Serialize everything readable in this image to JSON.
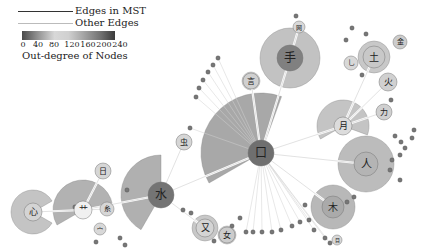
{
  "legend": {
    "mst_label": "Edges in MST",
    "other_label": "Other Edges",
    "colorbar_title": "Out-degree of Nodes",
    "colorbar_ticks": [
      "0",
      "40",
      "80",
      "120",
      "160",
      "200",
      "240"
    ],
    "mst_color": "#333333",
    "other_color": "#bbbbbb"
  },
  "nodes": [
    {
      "id": "kou",
      "label": "口",
      "x": 261,
      "y": 153,
      "r": 13,
      "fill": "#6f6f6f",
      "fan_r": 60,
      "fan_start": 150,
      "fan_end": 290,
      "fan_fill": "#a8a8a8"
    },
    {
      "id": "shui",
      "label": "水",
      "x": 161,
      "y": 195,
      "r": 13,
      "fill": "#747474",
      "fan_r": 40,
      "fan_start": 120,
      "fan_end": 270,
      "fan_fill": "#b0b0b0"
    },
    {
      "id": "shou",
      "label": "手",
      "x": 290,
      "y": 58,
      "r": 13,
      "fill": "#808080",
      "fan_r": 30,
      "fan_start": 0,
      "fan_end": 360,
      "fan_fill": "#c2c2c2"
    },
    {
      "id": "ren",
      "label": "人",
      "x": 366,
      "y": 164,
      "r": 12,
      "fill": "#b4b4b4",
      "fan_r": 28,
      "fan_start": 0,
      "fan_end": 360,
      "fan_fill": "#bcbcbc"
    },
    {
      "id": "mu",
      "label": "木",
      "x": 333,
      "y": 207,
      "r": 11,
      "fill": "#aaaaaa",
      "fan_r": 22,
      "fan_start": 0,
      "fan_end": 360,
      "fan_fill": "#b8b8b8"
    },
    {
      "id": "yue",
      "label": "月",
      "x": 343,
      "y": 126,
      "r": 9,
      "fill": "#dcdcdc",
      "fan_r": 26,
      "fan_start": 150,
      "fan_end": 380,
      "fan_fill": "#c4c4c4"
    },
    {
      "id": "tu",
      "label": "土",
      "x": 374,
      "y": 57,
      "r": 11,
      "fill": "#c8c8c8",
      "fan_r": 16,
      "fan_start": 0,
      "fan_end": 360,
      "fan_fill": "#c8c8c8"
    },
    {
      "id": "huo",
      "label": "火",
      "x": 388,
      "y": 82,
      "r": 9,
      "fill": "#d0d0d0",
      "fan_r": 9,
      "fan_start": 0,
      "fan_end": 360,
      "fan_fill": "#d0d0d0"
    },
    {
      "id": "xin",
      "label": "心",
      "x": 33,
      "y": 212,
      "r": 9,
      "fill": "#d4d4d4",
      "fan_r": 22,
      "fan_start": 30,
      "fan_end": 330,
      "fan_fill": "#c4c4c4"
    },
    {
      "id": "cao",
      "label": "艹",
      "x": 83,
      "y": 210,
      "r": 9,
      "fill": "#f0f0f0",
      "fan_r": 30,
      "fan_start": 150,
      "fan_end": 350,
      "fan_fill": "#b2b2b2"
    },
    {
      "id": "ri",
      "label": "日",
      "x": 103,
      "y": 171,
      "r": 8,
      "fill": "#d6d6d6",
      "fan_r": 8,
      "fan_start": 0,
      "fan_end": 360,
      "fan_fill": "#d6d6d6"
    },
    {
      "id": "chong",
      "label": "虫",
      "x": 184,
      "y": 142,
      "r": 8,
      "fill": "#d6d6d6",
      "fan_r": 8,
      "fan_start": 0,
      "fan_end": 360,
      "fan_fill": "#d6d6d6"
    },
    {
      "id": "yan",
      "label": "言",
      "x": 251,
      "y": 81,
      "r": 8,
      "fill": "#d0d0d0",
      "fan_r": 9,
      "fan_start": 0,
      "fan_end": 360,
      "fan_fill": "#d0d0d0"
    },
    {
      "id": "you",
      "label": "又",
      "x": 205,
      "y": 228,
      "r": 9,
      "fill": "#d4d4d4",
      "fan_r": 13,
      "fan_start": 0,
      "fan_end": 360,
      "fan_fill": "#c8c8c8"
    },
    {
      "id": "nv",
      "label": "女",
      "x": 227,
      "y": 235,
      "r": 8,
      "fill": "#cccccc",
      "fan_r": 9,
      "fan_start": 0,
      "fan_end": 360,
      "fan_fill": "#cccccc"
    },
    {
      "id": "si",
      "label": "糸",
      "x": 107,
      "y": 209,
      "r": 7,
      "fill": "#d6d6d6",
      "fan_r": 7,
      "fan_start": 0,
      "fan_end": 360,
      "fan_fill": "#d6d6d6"
    },
    {
      "id": "mian",
      "label": "宀",
      "x": 100,
      "y": 229,
      "r": 6,
      "fill": "#d8d8d8",
      "fan_r": 6,
      "fan_start": 0,
      "fan_end": 360,
      "fan_fill": "#d8d8d8"
    },
    {
      "id": "jin",
      "label": "金",
      "x": 400,
      "y": 42,
      "r": 7,
      "fill": "#cccccc",
      "fan_r": 7,
      "fan_start": 0,
      "fan_end": 360,
      "fan_fill": "#cccccc"
    },
    {
      "id": "yi",
      "label": "乚",
      "x": 351,
      "y": 63,
      "r": 7,
      "fill": "#d8d8d8",
      "fan_r": 7,
      "fan_start": 0,
      "fan_end": 360,
      "fan_fill": "#d8d8d8"
    },
    {
      "id": "li",
      "label": "力",
      "x": 384,
      "y": 112,
      "r": 8,
      "fill": "#d0d0d0",
      "fan_r": 8,
      "fan_start": 0,
      "fan_end": 360,
      "fan_fill": "#d0d0d0"
    },
    {
      "id": "mu2",
      "label": "目",
      "x": 337,
      "y": 240,
      "r": 5,
      "fill": "#d8d8d8",
      "fan_r": 5,
      "fan_start": 0,
      "fan_end": 360,
      "fan_fill": "#d8d8d8"
    },
    {
      "id": "wang",
      "label": "网",
      "x": 299,
      "y": 27,
      "r": 6,
      "fill": "#d8d8d8",
      "fan_r": 6,
      "fan_start": 0,
      "fan_end": 360,
      "fan_fill": "#d8d8d8"
    }
  ],
  "small_nodes": [
    [
      246,
      232
    ],
    [
      253,
      232
    ],
    [
      262,
      232
    ],
    [
      272,
      232
    ],
    [
      281,
      230
    ],
    [
      292,
      226
    ],
    [
      300,
      222
    ],
    [
      309,
      220
    ],
    [
      314,
      230
    ],
    [
      218,
      58
    ],
    [
      213,
      65
    ],
    [
      208,
      72
    ],
    [
      203,
      80
    ],
    [
      199,
      88
    ],
    [
      196,
      97
    ],
    [
      190,
      128
    ],
    [
      414,
      130
    ],
    [
      412,
      138
    ],
    [
      405,
      148
    ],
    [
      400,
      155
    ],
    [
      392,
      160
    ],
    [
      390,
      170
    ],
    [
      400,
      180
    ],
    [
      362,
      75
    ],
    [
      352,
      28
    ],
    [
      366,
      34
    ],
    [
      391,
      100
    ],
    [
      395,
      136
    ],
    [
      401,
      142
    ],
    [
      296,
      16
    ],
    [
      346,
      40
    ],
    [
      120,
      238
    ],
    [
      125,
      245
    ],
    [
      96,
      242
    ],
    [
      183,
      210
    ],
    [
      191,
      213
    ],
    [
      127,
      190
    ],
    [
      75,
      207
    ],
    [
      214,
      241
    ],
    [
      232,
      226
    ],
    [
      240,
      218
    ],
    [
      354,
      197
    ],
    [
      347,
      202
    ],
    [
      325,
      238
    ],
    [
      330,
      243
    ],
    [
      305,
      205
    ]
  ],
  "mst_edges": [
    [
      "kou",
      "shui"
    ],
    [
      "shui",
      "cao"
    ],
    [
      "cao",
      "xin"
    ],
    [
      "cao",
      "ri"
    ],
    [
      "shui",
      "chong"
    ],
    [
      "kou",
      "shou"
    ],
    [
      "kou",
      "yan"
    ],
    [
      "kou",
      "yue"
    ],
    [
      "kou",
      "ren"
    ],
    [
      "kou",
      "mu"
    ],
    [
      "yue",
      "tu"
    ],
    [
      "yue",
      "huo"
    ],
    [
      "yue",
      "li"
    ],
    [
      "shui",
      "you"
    ],
    [
      "cao",
      "si"
    ],
    [
      "shou",
      "wang"
    ]
  ],
  "fan_center": {
    "kou_mass": [
      261,
      153
    ]
  },
  "colors": {
    "node_dark": "#6f6f6f",
    "node_mid": "#a8a8a8",
    "node_light": "#d8d8d8",
    "edge_other": "#d0d0d0",
    "edge_mst": "#ffffff"
  }
}
